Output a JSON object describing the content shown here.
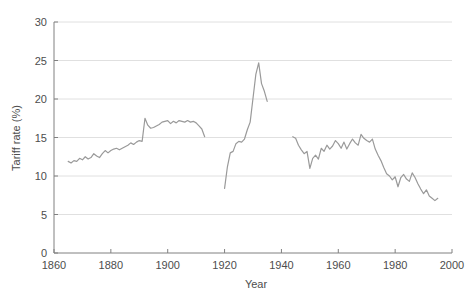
{
  "chart_data": {
    "type": "line",
    "title": "",
    "xlabel": "Year",
    "ylabel": "Tariff rate (%)",
    "xlim": [
      1860,
      2000
    ],
    "ylim": [
      0,
      30
    ],
    "xticks": [
      1860,
      1880,
      1900,
      1920,
      1940,
      1960,
      1980,
      2000
    ],
    "yticks": [
      0,
      5,
      10,
      15,
      20,
      25,
      30
    ],
    "grid": "horizontal",
    "legend": "none",
    "line_color": "#9a9a9a",
    "axis_color": "#808080",
    "grid_color": "#e0e0e0",
    "text_color": "#4d4d4d",
    "background": "#ffffff",
    "series": [
      {
        "name": "Tariff rate",
        "segments": [
          {
            "name": "1865-1913",
            "x": [
              1865,
              1866,
              1867,
              1868,
              1869,
              1870,
              1871,
              1872,
              1873,
              1874,
              1875,
              1876,
              1877,
              1878,
              1879,
              1880,
              1881,
              1882,
              1883,
              1884,
              1885,
              1886,
              1887,
              1888,
              1889,
              1890,
              1891,
              1892,
              1893,
              1894,
              1895,
              1896,
              1897,
              1898,
              1899,
              1900,
              1901,
              1902,
              1903,
              1904,
              1905,
              1906,
              1907,
              1908,
              1909,
              1910,
              1911,
              1912,
              1913
            ],
            "y": [
              11.9,
              11.7,
              12.0,
              11.9,
              12.3,
              12.1,
              12.5,
              12.2,
              12.4,
              12.9,
              12.6,
              12.4,
              12.9,
              13.3,
              13.0,
              13.3,
              13.5,
              13.6,
              13.4,
              13.6,
              13.8,
              14.0,
              14.3,
              14.1,
              14.4,
              14.6,
              14.5,
              17.5,
              16.6,
              16.2,
              16.3,
              16.5,
              16.7,
              17.0,
              17.1,
              17.2,
              16.8,
              17.1,
              16.9,
              17.2,
              17.1,
              17.0,
              17.2,
              17.0,
              17.1,
              16.9,
              16.5,
              16.1,
              15.1
            ]
          },
          {
            "name": "1920-1935",
            "x": [
              1920,
              1921,
              1922,
              1923,
              1924,
              1925,
              1926,
              1927,
              1928,
              1929,
              1930,
              1931,
              1932,
              1933,
              1934,
              1935
            ],
            "y": [
              8.4,
              11.2,
              13.0,
              13.2,
              14.2,
              14.5,
              14.4,
              14.8,
              16.0,
              17.0,
              20.1,
              23.2,
              24.7,
              22.0,
              21.0,
              19.7
            ]
          },
          {
            "name": "1944-1995",
            "x": [
              1944,
              1945,
              1946,
              1947,
              1948,
              1949,
              1950,
              1951,
              1952,
              1953,
              1954,
              1955,
              1956,
              1957,
              1958,
              1959,
              1960,
              1961,
              1962,
              1963,
              1964,
              1965,
              1966,
              1967,
              1968,
              1969,
              1970,
              1971,
              1972,
              1973,
              1974,
              1975,
              1976,
              1977,
              1978,
              1979,
              1980,
              1981,
              1982,
              1983,
              1984,
              1985,
              1986,
              1987,
              1988,
              1989,
              1990,
              1991,
              1992,
              1993,
              1994,
              1995
            ],
            "y": [
              15.1,
              14.9,
              14.0,
              13.4,
              12.9,
              13.2,
              11.0,
              12.3,
              12.7,
              12.2,
              13.6,
              13.2,
              14.0,
              13.5,
              13.9,
              14.6,
              14.2,
              13.6,
              14.4,
              13.5,
              14.2,
              14.8,
              14.3,
              14.0,
              15.4,
              14.9,
              14.6,
              14.4,
              14.8,
              13.5,
              12.7,
              12.0,
              11.1,
              10.3,
              10.0,
              9.5,
              9.9,
              8.6,
              9.8,
              10.2,
              9.6,
              9.3,
              10.4,
              9.8,
              9.0,
              8.3,
              7.7,
              8.2,
              7.4,
              7.1,
              6.8,
              7.1
            ]
          }
        ]
      }
    ]
  }
}
